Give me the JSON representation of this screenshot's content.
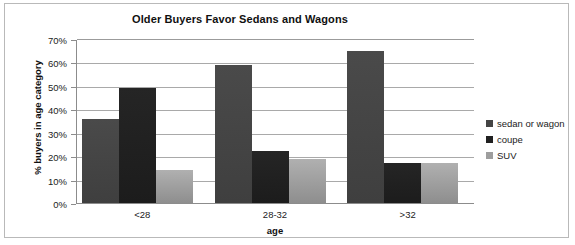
{
  "chart_data": {
    "type": "bar",
    "title": "Older Buyers Favor Sedans and Wagons",
    "xlabel": "age",
    "ylabel": "% buyers in age category",
    "categories": [
      "<28",
      "28-32",
      ">32"
    ],
    "series": [
      {
        "name": "sedan or wagon",
        "values": [
          36,
          59,
          65
        ],
        "color": "#444444"
      },
      {
        "name": "coupe",
        "values": [
          49,
          22,
          17
        ],
        "color": "#202020"
      },
      {
        "name": "SUV",
        "values": [
          14,
          19,
          17
        ],
        "color": "#9e9e9e"
      }
    ],
    "ylim": [
      0,
      70
    ],
    "ytick_step": 10,
    "ytick_labels": [
      "0%",
      "10%",
      "20%",
      "30%",
      "40%",
      "50%",
      "60%",
      "70%"
    ],
    "grid": true,
    "legend_position": "right",
    "value_suffix": "%"
  },
  "legend": {
    "items": [
      {
        "label": "sedan or wagon"
      },
      {
        "label": "coupe"
      },
      {
        "label": "SUV"
      }
    ]
  }
}
